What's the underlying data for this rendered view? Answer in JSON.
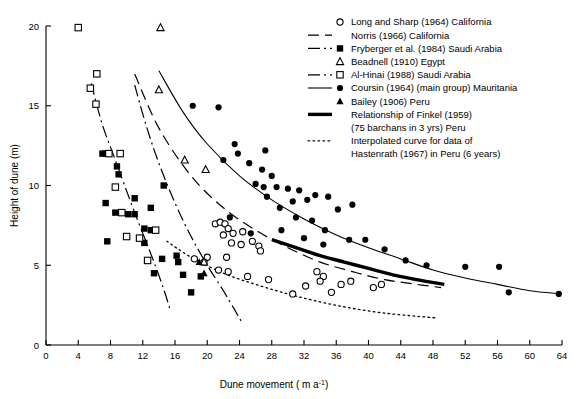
{
  "chart_data": {
    "type": "scatter",
    "title": "",
    "xlabel": "Dune movement ( m a -1)",
    "ylabel": "Height of dune (m)",
    "xlim": [
      0,
      64
    ],
    "ylim": [
      0,
      20
    ],
    "xticks": [
      0,
      4,
      8,
      12,
      16,
      20,
      24,
      28,
      32,
      36,
      40,
      44,
      48,
      52,
      56,
      60,
      64
    ],
    "yticks": [
      0,
      5,
      10,
      15,
      20
    ],
    "grid": false,
    "legend_position": "top-right",
    "series": [
      {
        "name": "Long and Sharp (1964) California",
        "marker": "open-circle",
        "points": [
          [
            21.0,
            7.6
          ],
          [
            21.6,
            7.7
          ],
          [
            22.2,
            7.6
          ],
          [
            22.6,
            7.3
          ],
          [
            22.0,
            6.9
          ],
          [
            23.2,
            7.0
          ],
          [
            24.4,
            7.1
          ],
          [
            23.0,
            6.4
          ],
          [
            24.2,
            6.3
          ],
          [
            25.6,
            6.5
          ],
          [
            26.4,
            6.2
          ],
          [
            26.6,
            5.9
          ],
          [
            20.0,
            5.5
          ],
          [
            22.4,
            5.5
          ],
          [
            18.4,
            5.4
          ],
          [
            19.6,
            5.2
          ],
          [
            21.4,
            4.7
          ],
          [
            22.6,
            4.6
          ],
          [
            25.0,
            4.3
          ],
          [
            27.6,
            4.1
          ],
          [
            33.6,
            4.6
          ],
          [
            34.4,
            4.3
          ],
          [
            34.0,
            4.0
          ],
          [
            32.2,
            3.7
          ],
          [
            36.6,
            3.8
          ],
          [
            37.8,
            4.0
          ],
          [
            35.4,
            3.3
          ],
          [
            30.6,
            3.2
          ],
          [
            40.6,
            3.6
          ],
          [
            41.6,
            3.8
          ]
        ]
      },
      {
        "name": "Norris (1966) California",
        "marker": "none",
        "line": "dashed",
        "curve": [
          [
            11.0,
            17.0
          ],
          [
            14.0,
            13.6
          ],
          [
            18.0,
            10.6
          ],
          [
            22.0,
            8.6
          ],
          [
            26.0,
            7.2
          ],
          [
            30.0,
            6.1
          ],
          [
            34.0,
            5.2
          ],
          [
            38.0,
            4.6
          ],
          [
            42.0,
            4.1
          ],
          [
            46.0,
            3.8
          ],
          [
            49.0,
            3.6
          ]
        ]
      },
      {
        "name": "Fryberger et al. (1984) Saudi Arabia",
        "marker": "filled-square",
        "line": "dash-dot",
        "points": [
          [
            7.0,
            12.0
          ],
          [
            7.4,
            12.0
          ],
          [
            8.8,
            11.2
          ],
          [
            9.0,
            10.7
          ],
          [
            7.4,
            8.9
          ],
          [
            8.6,
            8.3
          ],
          [
            10.2,
            8.2
          ],
          [
            11.0,
            8.2
          ],
          [
            13.0,
            8.6
          ],
          [
            12.2,
            7.3
          ],
          [
            13.0,
            7.2
          ],
          [
            7.6,
            6.5
          ],
          [
            12.2,
            6.4
          ],
          [
            11.0,
            9.2
          ],
          [
            16.2,
            5.6
          ],
          [
            14.4,
            5.4
          ],
          [
            16.4,
            5.2
          ],
          [
            13.4,
            4.5
          ],
          [
            17.0,
            4.4
          ],
          [
            19.2,
            4.3
          ],
          [
            18.0,
            3.3
          ],
          [
            14.6,
            10.0
          ]
        ],
        "curve": [
          [
            11.0,
            16.3
          ],
          [
            12.4,
            13.8
          ],
          [
            14.0,
            11.4
          ],
          [
            16.0,
            8.9
          ],
          [
            18.0,
            6.8
          ],
          [
            20.0,
            5.0
          ],
          [
            22.0,
            3.4
          ],
          [
            23.4,
            2.2
          ],
          [
            24.2,
            1.5
          ]
        ]
      },
      {
        "name": "Beadnell (1910) Egypt",
        "marker": "open-triangle",
        "points": [
          [
            14.2,
            19.9
          ],
          [
            14.0,
            16.0
          ],
          [
            17.2,
            11.6
          ],
          [
            19.8,
            11.0
          ],
          [
            19.6,
            5.2
          ]
        ]
      },
      {
        "name": "Al-Hinai (1988) Saudi Arabia",
        "marker": "open-square",
        "line": "dash-dot",
        "points": [
          [
            4.0,
            19.9
          ],
          [
            6.3,
            17.0
          ],
          [
            5.5,
            16.1
          ],
          [
            6.2,
            15.1
          ],
          [
            7.8,
            12.0
          ],
          [
            9.2,
            12.0
          ],
          [
            8.6,
            9.9
          ],
          [
            9.4,
            8.3
          ],
          [
            10.0,
            6.8
          ],
          [
            11.6,
            6.7
          ],
          [
            13.6,
            7.2
          ],
          [
            12.6,
            5.3
          ]
        ],
        "curve": [
          [
            5.6,
            16.4
          ],
          [
            7.0,
            13.8
          ],
          [
            8.6,
            11.6
          ],
          [
            10.4,
            9.1
          ],
          [
            12.0,
            7.0
          ],
          [
            13.4,
            5.2
          ],
          [
            14.6,
            3.5
          ],
          [
            15.4,
            2.2
          ]
        ]
      },
      {
        "name": "Coursin (1964) (main group) Mauritania",
        "marker": "filled-circle",
        "line": "solid",
        "points": [
          [
            18.2,
            15.0
          ],
          [
            21.4,
            14.9
          ],
          [
            23.4,
            12.6
          ],
          [
            23.8,
            12.0
          ],
          [
            22.0,
            11.6
          ],
          [
            25.2,
            11.4
          ],
          [
            26.0,
            10.1
          ],
          [
            27.0,
            9.9
          ],
          [
            27.4,
            9.3
          ],
          [
            28.6,
            9.9
          ],
          [
            30.0,
            9.8
          ],
          [
            31.4,
            9.7
          ],
          [
            30.6,
            9.0
          ],
          [
            32.4,
            9.1
          ],
          [
            33.4,
            9.4
          ],
          [
            35.0,
            9.3
          ],
          [
            29.0,
            8.6
          ],
          [
            31.0,
            8.0
          ],
          [
            33.0,
            7.8
          ],
          [
            36.2,
            8.5
          ],
          [
            38.0,
            8.8
          ],
          [
            34.6,
            7.2
          ],
          [
            22.8,
            8.0
          ],
          [
            25.4,
            7.0
          ],
          [
            29.2,
            7.2
          ],
          [
            32.0,
            6.7
          ],
          [
            34.4,
            6.3
          ],
          [
            37.6,
            6.6
          ],
          [
            39.6,
            6.6
          ],
          [
            42.0,
            6.0
          ],
          [
            44.6,
            5.3
          ],
          [
            47.2,
            5.0
          ],
          [
            52.0,
            4.9
          ],
          [
            56.2,
            4.9
          ],
          [
            57.4,
            3.3
          ],
          [
            63.6,
            3.2
          ],
          [
            27.2,
            12.2
          ],
          [
            26.8,
            11.0
          ],
          [
            28.0,
            10.6
          ]
        ],
        "curve": [
          [
            14.0,
            17.2
          ],
          [
            17.0,
            14.6
          ],
          [
            20.0,
            12.6
          ],
          [
            24.0,
            10.6
          ],
          [
            28.0,
            9.1
          ],
          [
            32.0,
            7.9
          ],
          [
            36.0,
            6.9
          ],
          [
            40.0,
            6.1
          ],
          [
            44.0,
            5.4
          ],
          [
            48.0,
            4.7
          ],
          [
            52.0,
            4.2
          ],
          [
            56.0,
            3.8
          ],
          [
            60.0,
            3.4
          ],
          [
            64.0,
            3.2
          ]
        ]
      },
      {
        "name": "Bailey (1906) Peru",
        "marker": "filled-triangle",
        "points": [
          [
            19.0,
            5.2
          ],
          [
            19.6,
            4.5
          ]
        ]
      },
      {
        "name": "Relationship of Finkel (1959) (75 barchans in 3 yrs) Peru",
        "marker": "none",
        "line": "thick-solid",
        "curve": [
          [
            28.0,
            6.6
          ],
          [
            31.0,
            6.1
          ],
          [
            34.0,
            5.6
          ],
          [
            37.0,
            5.2
          ],
          [
            40.0,
            4.8
          ],
          [
            43.0,
            4.4
          ],
          [
            46.0,
            4.1
          ],
          [
            49.4,
            3.8
          ]
        ]
      },
      {
        "name": "Interpolated curve for data of Hastenrath (1967) in Peru (6 years)",
        "marker": "none",
        "line": "dotted",
        "curve": [
          [
            15.0,
            6.5
          ],
          [
            18.0,
            5.5
          ],
          [
            22.0,
            4.5
          ],
          [
            26.0,
            3.8
          ],
          [
            30.0,
            3.2
          ],
          [
            34.0,
            2.7
          ],
          [
            38.0,
            2.3
          ],
          [
            42.0,
            2.0
          ],
          [
            46.0,
            1.8
          ],
          [
            48.4,
            1.7
          ]
        ]
      }
    ]
  },
  "axes": {
    "x_title": "Dune movement ( m a",
    "x_title_sup": "-1",
    "x_title_tail": ")",
    "y_title": "Height of dune (m)"
  },
  "legend": {
    "items": [
      {
        "label": "Long and Sharp (1964) California",
        "marker": "open-circle",
        "line": "none"
      },
      {
        "label": "Norris (1966) California",
        "marker": "none",
        "line": "dashed"
      },
      {
        "label": "Fryberger et al. (1984) Saudi Arabia",
        "marker": "filled-square",
        "line": "dash-dot"
      },
      {
        "label": "Beadnell (1910) Egypt",
        "marker": "open-triangle",
        "line": "none"
      },
      {
        "label": "Al-Hinai (1988) Saudi Arabia",
        "marker": "open-square",
        "line": "dash-dot"
      },
      {
        "label": "Coursin (1964) (main group) Mauritania",
        "marker": "filled-circle",
        "line": "solid"
      },
      {
        "label": "Bailey (1906) Peru",
        "marker": "filled-triangle",
        "line": "none"
      },
      {
        "label": "Relationship of Finkel (1959)",
        "label2": "(75 barchans in 3 yrs) Peru",
        "marker": "none",
        "line": "thick-solid"
      },
      {
        "label": "Interpolated curve for data of",
        "label2": "Hastenrath (1967) in Peru (6 years)",
        "marker": "none",
        "line": "dotted"
      }
    ]
  }
}
